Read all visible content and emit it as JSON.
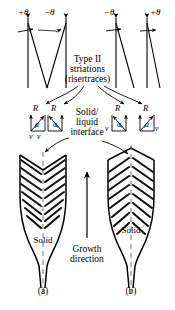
{
  "figure": {
    "title_block": {
      "line1": "Type II",
      "line2": "striations",
      "line3": "(risertraces)"
    },
    "interface_label": {
      "line1": "Solid/",
      "line2": "liquid",
      "line3": "interface"
    },
    "growth_label": {
      "line1": "Growth",
      "line2": "direction"
    },
    "angle_labels": {
      "a_left": "+θ",
      "a_right": "−θ",
      "b_left": "−θ",
      "b_right": "+θ"
    },
    "vector_labels": {
      "r": "R",
      "alpha": "α",
      "v": "v"
    },
    "region_labels": {
      "solid_a": "Solid",
      "solid_b": "Solid"
    },
    "captions": {
      "a": "(a)",
      "b": "(b)"
    },
    "colors": {
      "ink": "#000000",
      "background": "#ffffff",
      "hatch": "#1a1a1a"
    }
  }
}
